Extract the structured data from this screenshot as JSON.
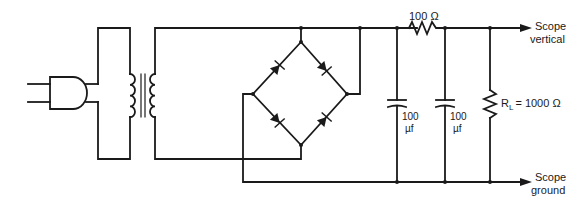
{
  "diagram": {
    "type": "circuit-schematic",
    "components": {
      "plug": {
        "name": "AC plug"
      },
      "transformer": {
        "name": "Transformer"
      },
      "bridge": {
        "name": "Diode bridge rectifier",
        "diode_count": 4
      },
      "series_resistor": {
        "label": "100 Ω"
      },
      "capacitor_1": {
        "value": "100",
        "unit": "µf"
      },
      "capacitor_2": {
        "value": "100",
        "unit": "µf"
      },
      "load_resistor": {
        "symbol": "R",
        "subscript": "L",
        "value": "= 1000 Ω"
      }
    },
    "outputs": {
      "vertical": {
        "line1": "Scope",
        "line2": "vertical"
      },
      "ground": {
        "line1": "Scope",
        "line2": "ground"
      }
    },
    "colors": {
      "ink": "#1a1a1a",
      "background": "#ffffff"
    }
  }
}
